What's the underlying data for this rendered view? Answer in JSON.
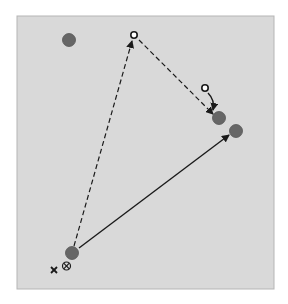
{
  "panel": {
    "x": 17,
    "y": 16,
    "width": 257,
    "height": 273,
    "fill": "#d9d9d9",
    "stroke": "#b5b5b5"
  },
  "colors": {
    "dot_fill": "#666666",
    "dot_stroke": "#555555",
    "line": "#1a1a1a",
    "open_circle_fill": "#ffffff"
  },
  "filled_dots": [
    {
      "id": "dot-top-left",
      "x": 69,
      "y": 40,
      "r": 6.5
    },
    {
      "id": "dot-target-a",
      "x": 219,
      "y": 118,
      "r": 6.5
    },
    {
      "id": "dot-target-b",
      "x": 236,
      "y": 131,
      "r": 6.5
    },
    {
      "id": "dot-origin",
      "x": 72,
      "y": 253,
      "r": 6.5
    }
  ],
  "open_circles": [
    {
      "id": "open-circle-top",
      "x": 134,
      "y": 35,
      "r": 3.2
    },
    {
      "id": "open-circle-small",
      "x": 205,
      "y": 88,
      "r": 3.2
    }
  ],
  "markers": {
    "cross": {
      "x": 54,
      "y": 270,
      "symbol": "×"
    },
    "circled_cross": {
      "x": 66,
      "y": 266,
      "symbol": "⊗"
    }
  }
}
